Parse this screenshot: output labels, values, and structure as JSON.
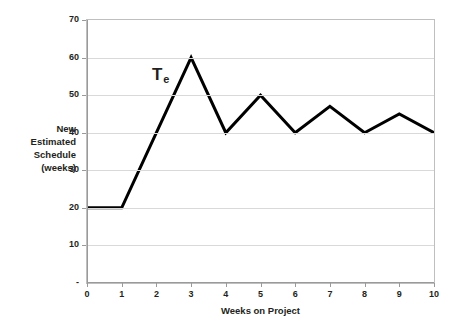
{
  "chart_data": {
    "type": "line",
    "title": "",
    "xlabel": "Weeks on Project",
    "ylabel": "New Estimated Schedule (weeks)",
    "ylabel_lines": [
      "New",
      "Estimated",
      "Schedule",
      "(weeks)"
    ],
    "series": [
      {
        "name": "Te",
        "label_text": "T",
        "label_subscript": "e",
        "color": "#000000",
        "line_width": 3,
        "x": [
          0,
          1,
          2,
          3,
          4,
          5,
          6,
          7,
          8,
          9,
          10
        ],
        "values": [
          20,
          20,
          40,
          60,
          40,
          50,
          40,
          47,
          40,
          45,
          40
        ]
      }
    ],
    "x": [
      0,
      1,
      2,
      3,
      4,
      5,
      6,
      7,
      8,
      9,
      10
    ],
    "xtick_labels": [
      "0",
      "1",
      "2",
      "3",
      "4",
      "5",
      "6",
      "7",
      "8",
      "9",
      "10"
    ],
    "ytick_values": [
      0,
      10,
      20,
      30,
      40,
      50,
      60,
      70
    ],
    "ytick_labels": [
      "-",
      "10",
      "20",
      "30",
      "40",
      "50",
      "60",
      "70"
    ],
    "xlim": [
      0,
      10
    ],
    "ylim": [
      0,
      70
    ],
    "grid": true,
    "grid_axis": "y",
    "grid_color": "#d9d9d9",
    "legend": false,
    "background_color": "#ffffff",
    "plot_border_color": "#bfbfbf",
    "axis_color": "#9a9a9a"
  }
}
